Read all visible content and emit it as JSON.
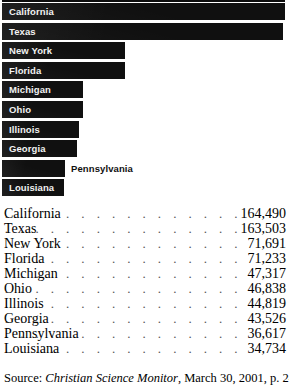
{
  "chart_data": {
    "type": "bar",
    "orientation": "horizontal",
    "title": "",
    "xlabel": "",
    "ylabel": "",
    "categories": [
      "California",
      "Texas",
      "New York",
      "Florida",
      "Michigan",
      "Ohio",
      "Illinois",
      "Georgia",
      "Pennsylvania",
      "Louisiana"
    ],
    "values": [
      164490,
      163503,
      71691,
      71233,
      47317,
      46838,
      44819,
      43526,
      36617,
      34734
    ],
    "value_labels": [
      "164,490",
      "163,503",
      "71,691",
      "71,233",
      "47,317",
      "46,838",
      "44,819",
      "43,526",
      "36,617",
      "34,734"
    ],
    "xlim": [
      0,
      164490
    ],
    "grid": false,
    "legend": null,
    "bar_color": "#101010",
    "background_color": "#ffffff",
    "label_color_inside": "#f2f2f2",
    "label_color_outside": "#101010"
  },
  "bars": [
    {
      "label": "California",
      "value_label": "164,490",
      "label_placement": "inside"
    },
    {
      "label": "Texas",
      "value_label": "163,503",
      "label_placement": "inside"
    },
    {
      "label": "New York",
      "value_label": "71,691",
      "label_placement": "inside"
    },
    {
      "label": "Florida",
      "value_label": "71,233",
      "label_placement": "inside"
    },
    {
      "label": "Michigan",
      "value_label": "47,317",
      "label_placement": "inside"
    },
    {
      "label": "Ohio",
      "value_label": "46,838",
      "label_placement": "inside"
    },
    {
      "label": "Illinois",
      "value_label": "44,819",
      "label_placement": "inside"
    },
    {
      "label": "Georgia",
      "value_label": "43,526",
      "label_placement": "inside"
    },
    {
      "label": "Pennsylvania",
      "value_label": "36,617",
      "label_placement": "outside"
    },
    {
      "label": "Louisiana",
      "value_label": "34,734",
      "label_placement": "inside"
    }
  ],
  "table": {
    "rows": [
      {
        "name": "California",
        "value": "164,490"
      },
      {
        "name": "Texas",
        "value": "163,503"
      },
      {
        "name": "New York",
        "value": "71,691"
      },
      {
        "name": "Florida",
        "value": "71,233"
      },
      {
        "name": "Michigan",
        "value": "47,317"
      },
      {
        "name": "Ohio",
        "value": "46,838"
      },
      {
        "name": "Illinois",
        "value": "44,819"
      },
      {
        "name": "Georgia",
        "value": "43,526"
      },
      {
        "name": "Pennsylvania",
        "value": "36,617"
      },
      {
        "name": "Louisiana",
        "value": "34,734"
      }
    ],
    "leader": ". . . . . . . . . . . . . . . . . . . . . . . . . . . . . . . . . . . . . . . ."
  },
  "source": {
    "prefix": "Source: ",
    "publication": "Christian Science Monitor",
    "suffix": ", March 30, 2001, p. 24,"
  }
}
